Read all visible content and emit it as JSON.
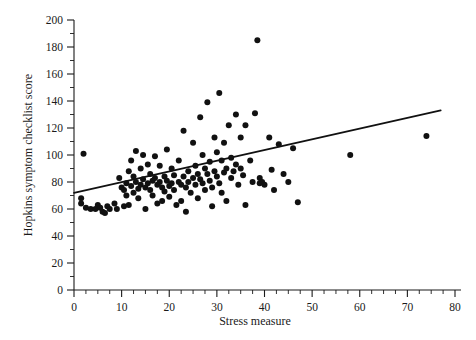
{
  "chart_data": {
    "type": "scatter",
    "title": "",
    "xlabel": "Stress measure",
    "ylabel": "Hopkins symptom checklist score",
    "xlim": [
      0,
      80
    ],
    "ylim": [
      0,
      200
    ],
    "grid": false,
    "legend": null,
    "x_ticks": [
      0,
      10,
      20,
      30,
      40,
      50,
      60,
      70,
      80
    ],
    "x_tick_labels": [
      "0",
      "10",
      "20",
      "30",
      "40",
      "50",
      "60",
      "70",
      "80"
    ],
    "x_minor_step": 2.5,
    "y_ticks": [
      0,
      20,
      40,
      60,
      80,
      100,
      120,
      140,
      160,
      180,
      200
    ],
    "y_tick_labels": [
      "0",
      "20",
      "40",
      "60",
      "80",
      "100",
      "120",
      "140",
      "160",
      "180",
      "200"
    ],
    "y_minor_step": 10,
    "marker_color": "#111111",
    "marker_size": 3.0,
    "fit_line": {
      "label": "least-squares regression line",
      "color": "#111111",
      "x_start": 0,
      "y_start": 72,
      "x_end": 77,
      "y_end": 133
    },
    "points": [
      [
        1.5,
        68
      ],
      [
        1.5,
        64
      ],
      [
        2.0,
        101
      ],
      [
        2.5,
        61
      ],
      [
        3.5,
        60
      ],
      [
        4.5,
        60
      ],
      [
        5.0,
        63
      ],
      [
        5.5,
        61
      ],
      [
        6.0,
        58
      ],
      [
        6.5,
        57
      ],
      [
        7.0,
        62
      ],
      [
        7.5,
        60
      ],
      [
        8.5,
        64
      ],
      [
        9.0,
        60
      ],
      [
        9.5,
        83
      ],
      [
        10.0,
        76
      ],
      [
        10.5,
        74
      ],
      [
        10.5,
        62
      ],
      [
        11.0,
        79
      ],
      [
        11.0,
        70
      ],
      [
        11.5,
        88
      ],
      [
        11.5,
        63
      ],
      [
        12.0,
        96
      ],
      [
        12.0,
        77
      ],
      [
        12.5,
        84
      ],
      [
        12.5,
        72
      ],
      [
        13.0,
        103
      ],
      [
        13.0,
        80
      ],
      [
        13.5,
        75
      ],
      [
        13.5,
        68
      ],
      [
        14.0,
        90
      ],
      [
        14.0,
        78
      ],
      [
        14.5,
        100
      ],
      [
        14.5,
        82
      ],
      [
        15.0,
        76
      ],
      [
        15.0,
        60
      ],
      [
        15.5,
        93
      ],
      [
        15.5,
        79
      ],
      [
        16.0,
        86
      ],
      [
        16.0,
        74
      ],
      [
        16.5,
        81
      ],
      [
        16.5,
        70
      ],
      [
        17.0,
        99
      ],
      [
        17.0,
        83
      ],
      [
        17.5,
        78
      ],
      [
        17.5,
        64
      ],
      [
        18.0,
        92
      ],
      [
        18.0,
        80
      ],
      [
        18.5,
        76
      ],
      [
        18.5,
        66
      ],
      [
        19.0,
        84
      ],
      [
        19.0,
        73
      ],
      [
        19.5,
        104
      ],
      [
        19.5,
        81
      ],
      [
        20.0,
        77
      ],
      [
        20.0,
        69
      ],
      [
        20.5,
        90
      ],
      [
        20.5,
        79
      ],
      [
        21.0,
        85
      ],
      [
        21.0,
        74
      ],
      [
        21.5,
        63
      ],
      [
        22.0,
        96
      ],
      [
        22.0,
        80
      ],
      [
        22.5,
        78
      ],
      [
        22.5,
        66
      ],
      [
        23.0,
        118
      ],
      [
        23.0,
        84
      ],
      [
        23.5,
        76
      ],
      [
        23.5,
        58
      ],
      [
        24.0,
        88
      ],
      [
        24.0,
        80
      ],
      [
        24.5,
        72
      ],
      [
        25.0,
        109
      ],
      [
        25.0,
        83
      ],
      [
        25.5,
        92
      ],
      [
        25.5,
        78
      ],
      [
        26.0,
        86
      ],
      [
        26.0,
        68
      ],
      [
        26.5,
        128
      ],
      [
        26.5,
        82
      ],
      [
        27.0,
        100
      ],
      [
        27.0,
        79
      ],
      [
        27.5,
        90
      ],
      [
        27.5,
        74
      ],
      [
        28.0,
        139
      ],
      [
        28.0,
        86
      ],
      [
        28.5,
        95
      ],
      [
        28.5,
        81
      ],
      [
        29.0,
        76
      ],
      [
        29.0,
        62
      ],
      [
        29.5,
        113
      ],
      [
        29.5,
        88
      ],
      [
        30.0,
        102
      ],
      [
        30.0,
        84
      ],
      [
        30.5,
        146
      ],
      [
        30.5,
        79
      ],
      [
        31.0,
        96
      ],
      [
        31.0,
        72
      ],
      [
        31.5,
        109
      ],
      [
        31.5,
        87
      ],
      [
        32.0,
        90
      ],
      [
        32.0,
        66
      ],
      [
        32.5,
        122
      ],
      [
        33.0,
        98
      ],
      [
        33.0,
        83
      ],
      [
        33.5,
        88
      ],
      [
        34.0,
        130
      ],
      [
        34.0,
        93
      ],
      [
        34.5,
        78
      ],
      [
        35.0,
        113
      ],
      [
        35.0,
        90
      ],
      [
        35.5,
        85
      ],
      [
        36.0,
        122
      ],
      [
        36.0,
        63
      ],
      [
        37.0,
        96
      ],
      [
        37.5,
        80
      ],
      [
        38.0,
        131
      ],
      [
        38.5,
        185
      ],
      [
        39.0,
        83
      ],
      [
        39.0,
        79
      ],
      [
        39.5,
        80
      ],
      [
        40.0,
        78
      ],
      [
        41.0,
        113
      ],
      [
        41.5,
        89
      ],
      [
        42.0,
        74
      ],
      [
        43.0,
        108
      ],
      [
        44.0,
        86
      ],
      [
        45.0,
        80
      ],
      [
        46.0,
        105
      ],
      [
        47.0,
        65
      ],
      [
        58.0,
        100
      ],
      [
        74.0,
        114
      ]
    ],
    "n_points": 130
  }
}
